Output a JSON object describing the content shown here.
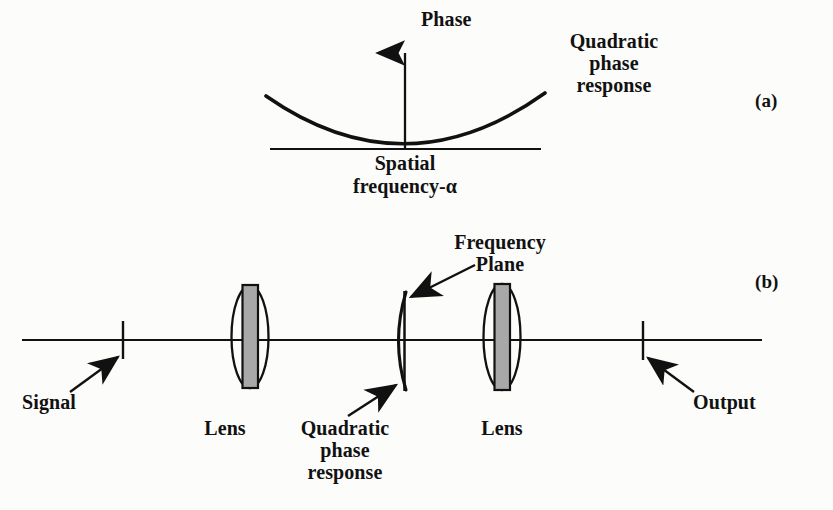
{
  "figure": {
    "kind": "optics-diagram",
    "background_color": "#fcfcfb",
    "ink_color": "#111111",
    "lens_fill_color": "#a8a8a8"
  },
  "panel_a": {
    "id_label": "(a)",
    "y_axis_label": "Phase",
    "x_axis_label_line1": "Spatial",
    "x_axis_label_line2": "frequency-α",
    "curve_annotation_line1": "Quadratic",
    "curve_annotation_line2": "phase",
    "curve_annotation_line3": "response",
    "plot": {
      "type": "line",
      "title": "",
      "xlabel": "Spatial frequency-α",
      "ylabel": "Phase",
      "grid": false,
      "legend": "none",
      "x": [
        -1.0,
        -0.875,
        -0.75,
        -0.625,
        -0.5,
        -0.375,
        -0.25,
        -0.125,
        0.0,
        0.125,
        0.25,
        0.375,
        0.5,
        0.625,
        0.75,
        0.875,
        1.0
      ],
      "y": [
        1.0,
        0.766,
        0.563,
        0.391,
        0.25,
        0.141,
        0.063,
        0.016,
        0.0,
        0.016,
        0.063,
        0.141,
        0.25,
        0.391,
        0.563,
        0.766,
        1.0
      ],
      "xlim": [
        -1.0,
        1.0
      ],
      "ylim": [
        0.0,
        1.0
      ],
      "curve_form": "quadratic"
    }
  },
  "panel_b": {
    "id_label": "(b)",
    "labels": {
      "signal": "Signal",
      "lens_left": "Lens",
      "lens_right": "Lens",
      "output": "Output",
      "frequency_plane_line1": "Frequency",
      "frequency_plane_line2": "Plane",
      "quadratic_line1": "Quadratic",
      "quadratic_line2": "phase",
      "quadratic_line3": "response"
    },
    "elements": [
      {
        "name": "signal-plane-tick",
        "type": "tick",
        "x": 123
      },
      {
        "name": "left-lens",
        "type": "lens",
        "x": 250
      },
      {
        "name": "frequency-plane-line",
        "type": "plane",
        "x": 404
      },
      {
        "name": "quadratic-phase-arc",
        "type": "arc",
        "x": 399
      },
      {
        "name": "right-lens",
        "type": "lens",
        "x": 502
      },
      {
        "name": "output-plane-tick",
        "type": "tick",
        "x": 643
      }
    ],
    "optical_axis": {
      "x_start": 22,
      "x_end": 762,
      "y": 340
    }
  }
}
